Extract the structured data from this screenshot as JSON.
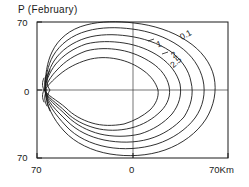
{
  "chart_data": {
    "type": "line",
    "title": "P (February)",
    "subtitle": "",
    "xlabel": "",
    "ylabel": "",
    "xlim": [
      -70,
      70
    ],
    "ylim": [
      -70,
      70
    ],
    "x_ticks": [
      "70",
      "0",
      "70Km"
    ],
    "x_tick_values": [
      -70,
      0,
      70
    ],
    "y_ticks": [
      "70",
      "0",
      "70"
    ],
    "y_tick_values": [
      70,
      0,
      -70
    ],
    "grid": false,
    "legend": "none",
    "crosshair_axes": true,
    "contour_levels": [
      "0.1",
      "1",
      "2",
      "2.5"
    ],
    "contour_labels": [
      {
        "text": "0.1",
        "x": 178,
        "y": 33,
        "rotate": -28
      },
      {
        "text": "1",
        "x": 155,
        "y": 40,
        "rotate": -20
      },
      {
        "text": "2",
        "x": 169,
        "y": 52,
        "rotate": -35
      },
      {
        "text": "2.5",
        "x": 168,
        "y": 62,
        "rotate": -40
      }
    ],
    "series": [
      {
        "name": "contour-1-outer",
        "level": "0.1"
      },
      {
        "name": "contour-2",
        "level": "1"
      },
      {
        "name": "contour-3",
        "level": "2"
      },
      {
        "name": "contour-4",
        "level": "2.5"
      },
      {
        "name": "contour-5",
        "level": ""
      },
      {
        "name": "contour-6-inner",
        "level": ""
      }
    ]
  },
  "frame": {
    "left": 37,
    "right": 228,
    "top": 22,
    "bottom": 158
  }
}
